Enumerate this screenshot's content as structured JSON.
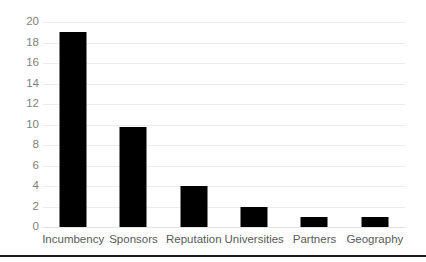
{
  "chart_data": {
    "type": "bar",
    "title": "",
    "subtitle": "",
    "xlabel": "",
    "ylabel": "",
    "categories": [
      "Incumbency",
      "Sponsors",
      "Reputation",
      "Universities",
      "Partners",
      "Geography"
    ],
    "values": [
      19,
      9.8,
      4,
      2,
      1,
      1
    ],
    "series": [
      {
        "name": "",
        "values": [
          19,
          9.8,
          4,
          2,
          1,
          1
        ]
      }
    ],
    "ylim": [
      0,
      20
    ],
    "y_ticks": [
      0,
      2,
      4,
      6,
      8,
      10,
      12,
      14,
      16,
      18,
      20
    ],
    "y_tick_labels": [
      "0",
      "2",
      "4",
      "6",
      "8",
      "10",
      "12",
      "14",
      "16",
      "18",
      "20"
    ],
    "grid": "horizontal",
    "legend": "none",
    "annotations": [],
    "colors": {
      "bar": "#000000",
      "gridline": "#eceaea",
      "y_tick_text": "#7f7f7f",
      "x_tick_text": "#595959",
      "background": "#ffffff",
      "bottom_rule": "#1a1a1a"
    }
  }
}
